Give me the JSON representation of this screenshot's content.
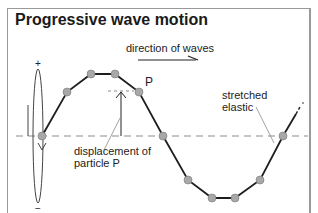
{
  "title": "Progressive wave motion",
  "labels": {
    "direction": "direction of waves",
    "particle": "P",
    "displacement_line1": "displacement of",
    "displacement_line2": "particle P",
    "elastic_line1": "stretched",
    "elastic_line2": "elastic",
    "plus": "+",
    "minus": "−"
  },
  "colors": {
    "line": "#1e1e1e",
    "dot": "#a8a8a8",
    "dash": "#8a8a8a"
  }
}
